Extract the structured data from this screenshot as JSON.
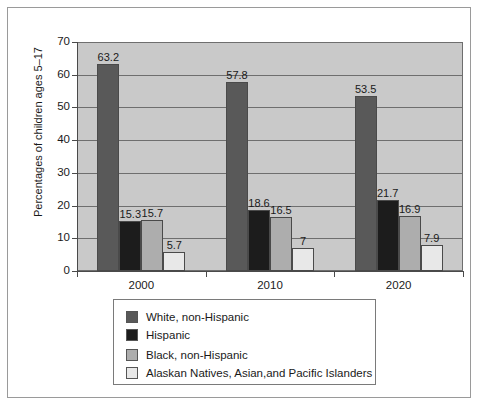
{
  "chart_data": {
    "type": "bar",
    "title": "",
    "xlabel": "",
    "ylabel": "Percentages of children ages 5–17",
    "ylim": [
      0,
      70
    ],
    "yticks": [
      0,
      10,
      20,
      30,
      40,
      50,
      60,
      70
    ],
    "grid": true,
    "legend_position": "bottom",
    "categories": [
      "2000",
      "2010",
      "2020"
    ],
    "series": [
      {
        "name": "White, non-Hispanic",
        "color": "#595959",
        "values": [
          63.2,
          57.8,
          53.5
        ],
        "labels": [
          "63.2",
          "57.8",
          "53.5"
        ]
      },
      {
        "name": "Hispanic",
        "color": "#1c1c1c",
        "values": [
          15.3,
          18.6,
          21.7
        ],
        "labels": [
          "15.3",
          "18.6",
          "21.7"
        ]
      },
      {
        "name": "Black, non-Hispanic",
        "color": "#adadad",
        "values": [
          15.7,
          16.5,
          16.9
        ],
        "labels": [
          "15.7",
          "16.5",
          "16.9"
        ]
      },
      {
        "name": "Alaskan Natives, Asian,and Pacific Islanders",
        "color": "#e8e8e8",
        "values": [
          5.7,
          7,
          7.9
        ],
        "labels": [
          "5.7",
          "7",
          "7.9"
        ]
      }
    ]
  },
  "axis": {
    "y_tick_labels": [
      "70",
      "60",
      "50",
      "40",
      "30",
      "20",
      "10",
      "0"
    ],
    "x_tick_labels": [
      "2000",
      "2010",
      "2020"
    ],
    "y_title": "Percentages of children ages 5–17"
  },
  "legend": {
    "items": [
      {
        "label": "White, non-Hispanic",
        "color": "#595959"
      },
      {
        "label": "Hispanic",
        "color": "#1c1c1c"
      },
      {
        "label": "Black, non-Hispanic",
        "color": "#adadad"
      },
      {
        "label": "Alaskan Natives, Asian,and Pacific Islanders",
        "color": "#e8e8e8"
      }
    ]
  }
}
